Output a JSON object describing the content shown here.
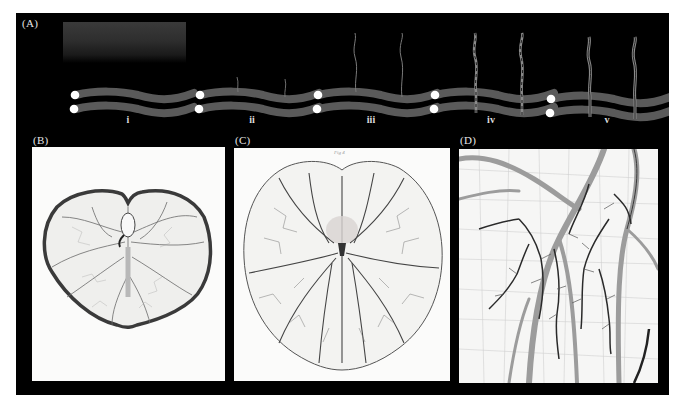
{
  "figure": {
    "panels": [
      {
        "id": "A",
        "label": "(A)",
        "description": "Schematic stages of vessel sprouting from paired tubes"
      },
      {
        "id": "B",
        "label": "(B)",
        "description": "Engraving of early embryonic yolk-sac vasculature"
      },
      {
        "id": "C",
        "label": "(C)",
        "description": "Engraving of later yolk-sac vascular network",
        "plate_text": "Fig 4"
      },
      {
        "id": "D",
        "label": "(D)",
        "description": "Close-up engraving of branching blood vessels and capillary mesh"
      }
    ],
    "stages": [
      {
        "label": "i"
      },
      {
        "label": "ii"
      },
      {
        "label": "iii"
      },
      {
        "label": "iv"
      },
      {
        "label": "v"
      }
    ],
    "colors": {
      "background": "#000000",
      "tube": "#5a5a5a",
      "dot": "#ffffff",
      "sprout": "#8a8a8a",
      "label": "#e6e6e6",
      "paper": "#fbfbfa",
      "vessel_dark": "#2b2b2b",
      "vessel_mid": "#8c8c8c"
    }
  }
}
